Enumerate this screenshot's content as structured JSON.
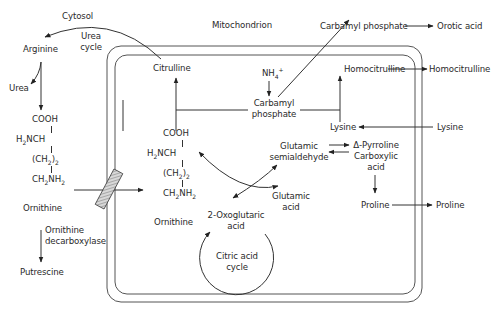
{
  "compartments": {
    "cytosol": "Cytosol",
    "mitochondrion": "Mitochondrion"
  },
  "cytosol": {
    "urea_cycle": [
      "Urea",
      "cycle"
    ],
    "arginine": "Arginine",
    "urea": "Urea",
    "ornithine_structure": [
      "COOH",
      "H2NCH",
      "(CH2)2",
      "CH2NH2"
    ],
    "ornithine": "Ornithine",
    "enzyme": [
      "Ornithine",
      "decarboxylase"
    ],
    "putrescine": "Putrescine",
    "carbamyl_phosphate_out": "Carbamyl phosphate",
    "orotic_acid": "Orotic acid",
    "homocitrulline_out": "Homocitrulline",
    "lysine_in": "Lysine",
    "proline_out": "Proline"
  },
  "mitochondrion": {
    "citrulline": "Citrulline",
    "nh4": "NH4+",
    "carbamyl_phosphate": [
      "Carbamyl",
      "phosphate"
    ],
    "homocitrulline": "Homocitrulline",
    "lysine": "Lysine",
    "ornithine_structure": [
      "COOH",
      "H2NCH",
      "(CH2)2",
      "CH2NH2"
    ],
    "ornithine": "Ornithine",
    "glutamic_semialdehyde": [
      "Glutamic",
      "semialdehyde"
    ],
    "pyrroline": [
      "Δ-Pyrroline",
      "Carboxylic",
      "acid"
    ],
    "glutamic_acid": [
      "Glutamic",
      "acid"
    ],
    "oxoglutaric": [
      "2-Oxoglutaric",
      "acid"
    ],
    "citric_cycle": [
      "Citric acid",
      "cycle"
    ],
    "proline": "Proline"
  },
  "colors": {
    "line": "#333333",
    "membrane": "#555555",
    "transporter_fill": "#bbbbbb"
  }
}
